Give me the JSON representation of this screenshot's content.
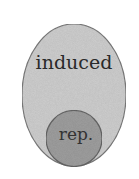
{
  "diagram": {
    "type": "nested-sets",
    "outer": {
      "label": "induced",
      "fill": "#cfcfcf",
      "stroke": "#7a7a7a"
    },
    "inner": {
      "label": "rep.",
      "fill": "#9f9f9f",
      "stroke": "#666666"
    },
    "relation": "rep. is a subset of induced"
  }
}
